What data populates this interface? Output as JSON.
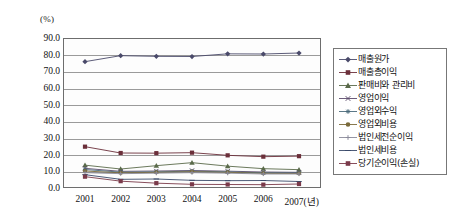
{
  "axis": {
    "unit_label": "(%)",
    "y_ticks": [
      "90.0",
      "80.0",
      "70.0",
      "60.0",
      "50.0",
      "40.0",
      "30.0",
      "20.0",
      "10.0",
      "0.0"
    ],
    "x_ticks": [
      "2001",
      "2002",
      "2003",
      "2004",
      "2005",
      "2006",
      "2007(년)"
    ]
  },
  "legend": {
    "items": [
      {
        "label": "매출원가",
        "marker": "diamond",
        "color": "#4a4a6a"
      },
      {
        "label": "매출총이익",
        "marker": "square",
        "color": "#6b2f3a"
      },
      {
        "label": "판매비와 관리비",
        "marker": "triangle",
        "color": "#5a6a4a"
      },
      {
        "label": "영업이익",
        "marker": "cross-x",
        "color": "#5b4a6b"
      },
      {
        "label": "영업외수익",
        "marker": "asterisk",
        "color": "#4a6a7a"
      },
      {
        "label": "영업외비용",
        "marker": "circle",
        "color": "#7a6a3a"
      },
      {
        "label": "법인세전순이익",
        "marker": "plus",
        "color": "#8a8a9a"
      },
      {
        "label": "법인세비용",
        "marker": "dash",
        "color": "#3a4a6a"
      },
      {
        "label": "당기순이익(손실)",
        "marker": "square",
        "color": "#7a3a4a"
      }
    ]
  },
  "chart_data": {
    "type": "line",
    "title": "",
    "xlabel": "(년)",
    "ylabel": "(%)",
    "ylim": [
      0,
      90
    ],
    "ytick_step": 10,
    "grid": true,
    "legend_position": "right",
    "categories": [
      "2001",
      "2002",
      "2003",
      "2004",
      "2005",
      "2006",
      "2007"
    ],
    "series": [
      {
        "name": "매출원가",
        "values": [
          75.8,
          79.4,
          79.0,
          78.9,
          80.5,
          80.4,
          81.0
        ]
      },
      {
        "name": "매출총이익",
        "values": [
          24.8,
          21.0,
          20.9,
          21.2,
          19.6,
          18.8,
          19.1
        ]
      },
      {
        "name": "판매비와 관리비",
        "values": [
          13.7,
          11.4,
          13.4,
          15.2,
          13.1,
          11.6,
          11.0
        ]
      },
      {
        "name": "영업이익",
        "values": [
          11.8,
          10.0,
          10.2,
          10.5,
          10.1,
          9.6,
          9.4
        ]
      },
      {
        "name": "영업외수익",
        "values": [
          11.1,
          9.5,
          9.7,
          10.1,
          9.7,
          9.1,
          9.0
        ]
      },
      {
        "name": "영업외비용",
        "values": [
          10.2,
          9.1,
          9.4,
          9.8,
          9.4,
          8.8,
          8.7
        ]
      },
      {
        "name": "법인세전순이익",
        "values": [
          9.2,
          8.6,
          8.9,
          9.2,
          8.9,
          8.4,
          8.4
        ]
      },
      {
        "name": "법인세비용",
        "values": [
          8.0,
          5.2,
          5.4,
          4.6,
          4.4,
          4.5,
          3.9
        ]
      },
      {
        "name": "당기순이익(손실)",
        "values": [
          6.8,
          4.1,
          2.9,
          2.2,
          2.1,
          2.0,
          2.4
        ]
      }
    ]
  }
}
